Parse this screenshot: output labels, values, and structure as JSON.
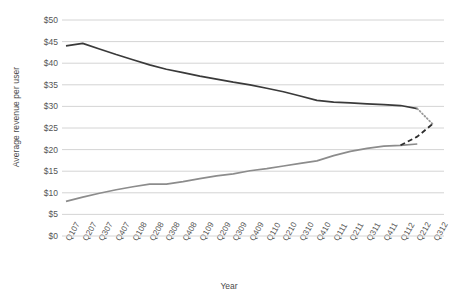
{
  "chart_data": {
    "type": "line",
    "title": "",
    "xlabel": "Year",
    "ylabel": "Average revenue per user",
    "ylim": [
      0,
      50
    ],
    "ytick_values": [
      0,
      5,
      10,
      15,
      20,
      25,
      30,
      35,
      40,
      45,
      50
    ],
    "ytick_labels": [
      "$0",
      "$5",
      "$10",
      "$15",
      "$20",
      "$25",
      "$30",
      "$35",
      "$40",
      "$45",
      "$50"
    ],
    "grid": "horizontal",
    "legend": "none",
    "categories": [
      "Q107",
      "Q207",
      "Q307",
      "Q407",
      "Q108",
      "Q208",
      "Q308",
      "Q408",
      "Q109",
      "Q209",
      "Q309",
      "Q409",
      "Q110",
      "Q210",
      "Q310",
      "Q410",
      "Q111",
      "Q211",
      "Q311",
      "Q411",
      "Q112",
      "Q212",
      "Q312"
    ],
    "series": [
      {
        "name": "declining-revenue-series",
        "style": "solid",
        "color": "#3a3a3a",
        "values": [
          44.0,
          44.6,
          43.3,
          42.0,
          40.8,
          39.6,
          38.6,
          37.8,
          37.0,
          36.3,
          35.6,
          35.0,
          34.2,
          33.4,
          32.4,
          31.4,
          31.0,
          30.8,
          30.6,
          30.4,
          30.2,
          29.5,
          null
        ]
      },
      {
        "name": "declining-revenue-projection",
        "style": "dotted",
        "color": "#9a9a9a",
        "values": [
          null,
          null,
          null,
          null,
          null,
          null,
          null,
          null,
          null,
          null,
          null,
          null,
          null,
          null,
          null,
          null,
          null,
          null,
          null,
          null,
          null,
          29.5,
          25.6
        ]
      },
      {
        "name": "rising-revenue-series",
        "style": "solid",
        "color": "#8c8c8c",
        "values": [
          8.0,
          9.0,
          9.9,
          10.7,
          11.4,
          12.0,
          12.0,
          12.6,
          13.3,
          13.9,
          14.4,
          15.1,
          15.6,
          16.2,
          16.8,
          17.4,
          18.6,
          19.6,
          20.3,
          20.8,
          21.0,
          21.3,
          null
        ]
      },
      {
        "name": "rising-revenue-projection",
        "style": "dashed",
        "color": "#2e2e2e",
        "values": [
          null,
          null,
          null,
          null,
          null,
          null,
          null,
          null,
          null,
          null,
          null,
          null,
          null,
          null,
          null,
          null,
          null,
          null,
          null,
          null,
          21.0,
          23.0,
          26.2
        ]
      }
    ]
  }
}
